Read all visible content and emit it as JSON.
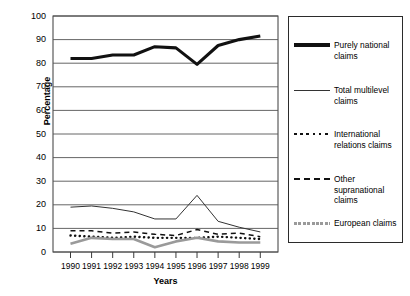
{
  "chart_data": {
    "type": "line",
    "title": "",
    "xlabel": "Years",
    "ylabel": "Percentage",
    "categories": [
      "1990",
      "1991",
      "1992",
      "1993",
      "1994",
      "1995",
      "1996",
      "1997",
      "1998",
      "1999"
    ],
    "x": [
      1990,
      1991,
      1992,
      1993,
      1994,
      1995,
      1996,
      1997,
      1998,
      1999
    ],
    "ylim": [
      0,
      100
    ],
    "ytick_values": [
      0,
      10,
      20,
      30,
      40,
      50,
      60,
      70,
      80,
      90,
      100
    ],
    "ytick_labels": [
      "0",
      "10",
      "20",
      "30",
      "40",
      "50",
      "60",
      "70",
      "80",
      "90",
      "100"
    ],
    "grid": "horizontal",
    "legend_position": "right-outside",
    "series": [
      {
        "name": "Purely national claims",
        "style": "solid-thick",
        "color": "#111111",
        "values": [
          82,
          82,
          83.5,
          83.5,
          87,
          86.5,
          79.5,
          87.5,
          90,
          91.5
        ]
      },
      {
        "name": "Total multilevel claims",
        "style": "solid-thin",
        "color": "#333333",
        "values": [
          19,
          19.5,
          18.5,
          17,
          14,
          14,
          24,
          13,
          10.5,
          8.5
        ]
      },
      {
        "name": "International relations claims",
        "style": "dotted",
        "color": "#111111",
        "values": [
          7,
          6.5,
          6,
          6.5,
          6,
          6,
          6,
          6.5,
          6,
          5.5
        ]
      },
      {
        "name": "Other supranational claims",
        "style": "dashed",
        "color": "#111111",
        "values": [
          9,
          9,
          8,
          8.5,
          7.5,
          7,
          9.5,
          7.5,
          8,
          6.5
        ]
      },
      {
        "name": "European claims",
        "style": "solid-grey",
        "color": "#9a9a9a",
        "values": [
          3.5,
          6,
          5.5,
          5.5,
          2,
          4.5,
          6,
          4.5,
          4,
          4
        ]
      }
    ]
  },
  "legend": {
    "items": [
      {
        "label": "Purely national claims"
      },
      {
        "label": "Total multilevel claims"
      },
      {
        "label": "International relations claims"
      },
      {
        "label": "Other supranational claims"
      },
      {
        "label": "European claims"
      }
    ]
  }
}
